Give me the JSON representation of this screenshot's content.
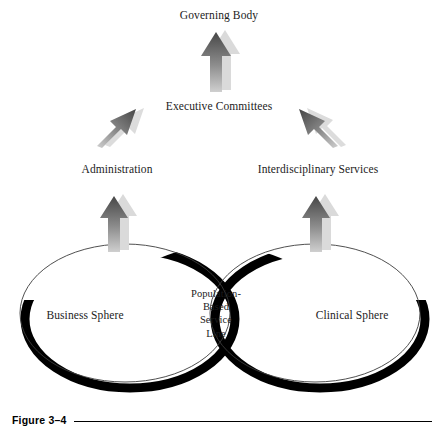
{
  "figure": {
    "caption_label": "Figure 3–4",
    "line_color": "#000000"
  },
  "diagram": {
    "type": "hierarchy-venn",
    "nodes": {
      "governing_body": "Governing Body",
      "executive_committees": "Executive Committees",
      "administration": "Administration",
      "interdisciplinary_services": "Interdisciplinary Services",
      "business_sphere": "Business Sphere",
      "clinical_sphere": "Clinical Sphere"
    },
    "overlap": {
      "line1": "Population-",
      "line2": "Based",
      "line3": "Service",
      "line4": "Line"
    },
    "colors": {
      "arrow_dark": "#4a4a4a",
      "arrow_mid": "#6e6e6e",
      "arrow_light": "#c9c9c9",
      "arrow_shadow": "#d8d8d8",
      "ellipse_outline": "#3c3c3c",
      "ellipse_shadow": "#000000",
      "text": "#1c1c1c",
      "background": "#ffffff"
    },
    "arrows": [
      {
        "name": "arrow-administration-to-business",
        "direction": "up"
      },
      {
        "name": "arrow-interdisciplinary-to-clinical",
        "direction": "up"
      },
      {
        "name": "arrow-administration-to-executive",
        "direction": "up-right"
      },
      {
        "name": "arrow-interdisciplinary-to-executive",
        "direction": "up-left"
      },
      {
        "name": "arrow-executive-to-governing",
        "direction": "up"
      }
    ]
  }
}
